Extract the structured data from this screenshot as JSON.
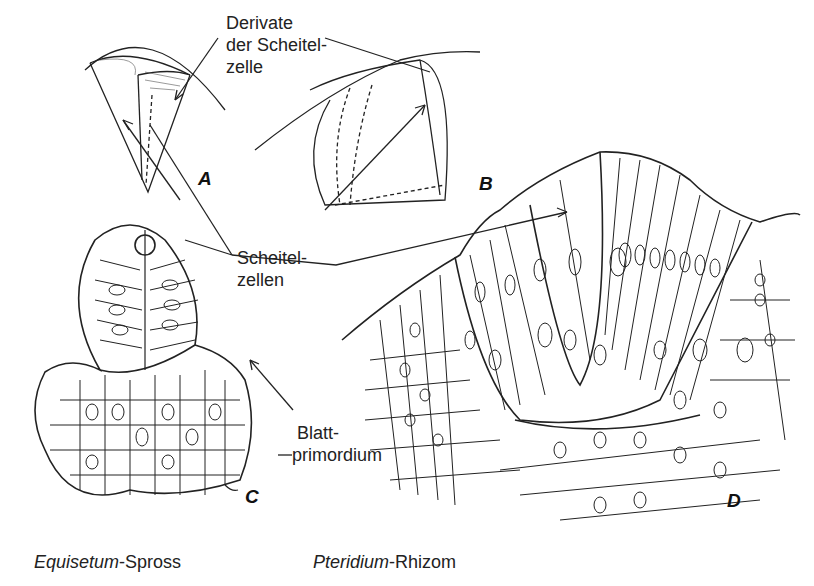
{
  "labels": {
    "derivate": [
      "Derivate",
      "der Scheitel-",
      "zelle"
    ],
    "scheitelzellen": [
      "Scheitel-",
      "zellen"
    ],
    "blattprimordium": [
      "Blatt-",
      "primordium"
    ]
  },
  "panels": {
    "a": "A",
    "b": "B",
    "c": "C",
    "d": "D"
  },
  "captions": {
    "left": {
      "italic": "Equisetum",
      "rest": "-Spross"
    },
    "right": {
      "italic": "Pteridium",
      "rest": "-Rhizom"
    }
  }
}
